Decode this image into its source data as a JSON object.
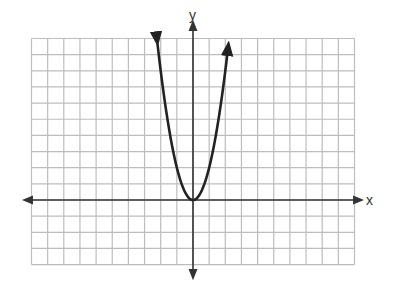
{
  "chart_data": {
    "type": "line",
    "title": "",
    "xlabel": "x",
    "ylabel": "y",
    "function": "y = 2x^2",
    "grid": true,
    "grid_units": {
      "x_min": -10,
      "x_max": 10,
      "y_min": -4,
      "y_max": 10,
      "step": 1
    },
    "tick_labels": false,
    "series": [
      {
        "name": "parabola",
        "x": [
          -2.2,
          -2,
          -1.5,
          -1,
          -0.5,
          0,
          0.5,
          1,
          1.5,
          2,
          2.2
        ],
        "y": [
          9.68,
          8,
          4.5,
          2,
          0.5,
          0,
          0.5,
          2,
          4.5,
          8,
          9.68
        ],
        "vertex": [
          0,
          0
        ],
        "arrows_at_ends": true
      }
    ],
    "colors": {
      "grid": "#bdbdbd",
      "axis": "#333333",
      "curve": "#222222"
    }
  },
  "labels": {
    "x_axis": "x",
    "y_axis": "y"
  }
}
